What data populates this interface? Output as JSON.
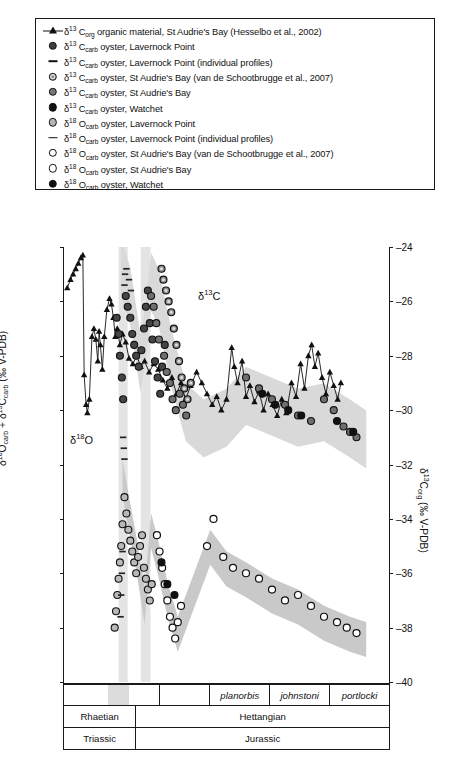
{
  "legend": {
    "items": [
      {
        "marker": "triangle-line",
        "delta": "13",
        "element": "C",
        "sub": "org",
        "text": " organic material, St Audrie's Bay (Hesselbo et al., 2002)"
      },
      {
        "marker": "circle-dark-fill",
        "delta": "13",
        "element": "C",
        "sub": "carb",
        "text": " oyster, Lavernock Point"
      },
      {
        "marker": "dash",
        "delta": "13",
        "element": "C",
        "sub": "carb",
        "text": " oyster, Lavernock Point (individual profiles)"
      },
      {
        "marker": "circle-ring",
        "delta": "13",
        "element": "C",
        "sub": "carb",
        "text": " oyster, St Audrie's Bay (van de Schootbrugge et al., 2007)"
      },
      {
        "marker": "circle-gray",
        "delta": "13",
        "element": "C",
        "sub": "carb",
        "text": " oyster, St Audrie's Bay"
      },
      {
        "marker": "circle-black",
        "delta": "13",
        "element": "C",
        "sub": "carb",
        "text": " oyster, Watchet"
      },
      {
        "marker": "circle-ltgray",
        "delta": "18",
        "element": "O",
        "sub": "carb",
        "text": " oyster, Lavernock Point"
      },
      {
        "marker": "dash",
        "delta": "18",
        "element": "O",
        "sub": "carb",
        "text": " oyster, Lavernock Point (individual profiles)"
      },
      {
        "marker": "circle-open",
        "delta": "18",
        "element": "O",
        "sub": "carb",
        "text": " oyster, St Audrie's Bay (van de Schootbrugge et al., 2007)"
      },
      {
        "marker": "circle-open",
        "delta": "18",
        "element": "O",
        "sub": "carb",
        "text": " oyster, St Audrie's Bay"
      },
      {
        "marker": "circle-black",
        "delta": "18",
        "element": "O",
        "sub": "carb",
        "text": " oyster, Watchet"
      }
    ]
  },
  "annotations": {
    "carbon": "δ13C",
    "oxygen": "δ18O"
  },
  "stratigraphy": {
    "biozones": [
      {
        "label": "",
        "span": 1.0
      },
      {
        "label": "",
        "span": 0.52
      },
      {
        "label": "planorbis",
        "span": 0.62
      },
      {
        "label": "johnstoni",
        "span": 0.62
      },
      {
        "label": "portlocki",
        "span": 0.62
      }
    ],
    "stages": [
      {
        "label": "Rhaetian",
        "span": 0.22
      },
      {
        "label": "Hettangian",
        "span": 0.78
      }
    ],
    "periods": [
      {
        "label": "Triassic",
        "span": 0.22
      },
      {
        "label": "Jurassic",
        "span": 0.78
      }
    ]
  },
  "chart_data": {
    "type": "scatter",
    "title": "",
    "xlabel": "",
    "grid": false,
    "legend_position": "top",
    "axes": {
      "left": {
        "label": "δ18Ocarb + δ13Ccarb (‰ V-PDB)",
        "ticks": [
          5,
          4,
          3,
          2,
          1,
          0,
          -1,
          -2,
          -3
        ],
        "ylim": [
          -3,
          5
        ]
      },
      "right": {
        "label": "δ13Corg (‰ V-PDB)",
        "ticks": [
          -24,
          -26,
          -28,
          -30,
          -32,
          -34,
          -36,
          -38,
          -40
        ],
        "ylim": [
          -40,
          -24
        ]
      }
    },
    "series": [
      {
        "name": "δ13Corg organic material, St Audrie's Bay (Hesselbo et al., 2002)",
        "marker": "triangle-line",
        "axis": "right",
        "points": [
          [
            0.01,
            -25.5
          ],
          [
            0.02,
            -25.2
          ],
          [
            0.028,
            -25.0
          ],
          [
            0.036,
            -24.8
          ],
          [
            0.044,
            -24.6
          ],
          [
            0.052,
            -24.4
          ],
          [
            0.058,
            -24.3
          ],
          [
            0.062,
            -28.7
          ],
          [
            0.068,
            -29.8
          ],
          [
            0.072,
            -30.1
          ],
          [
            0.078,
            -29.6
          ],
          [
            0.086,
            -27.3
          ],
          [
            0.092,
            -27.0
          ],
          [
            0.098,
            -27.4
          ],
          [
            0.104,
            -28.2
          ],
          [
            0.108,
            -27.1
          ],
          [
            0.112,
            -27.6
          ],
          [
            0.118,
            -28.5
          ],
          [
            0.124,
            -27.3
          ],
          [
            0.132,
            -26.3
          ],
          [
            0.14,
            -25.9
          ],
          [
            0.146,
            -26.1
          ],
          [
            0.152,
            -26.6
          ],
          [
            0.158,
            -27.3
          ],
          [
            0.164,
            -27.0
          ],
          [
            0.172,
            -27.6
          ],
          [
            0.18,
            -27.2
          ],
          [
            0.19,
            -27.5
          ],
          [
            0.2,
            -28.1
          ],
          [
            0.212,
            -28.3
          ],
          [
            0.224,
            -28.0
          ],
          [
            0.236,
            -28.4
          ],
          [
            0.248,
            -28.2
          ],
          [
            0.262,
            -28.6
          ],
          [
            0.276,
            -28.3
          ],
          [
            0.29,
            -28.5
          ],
          [
            0.304,
            -28.9
          ],
          [
            0.318,
            -29.2
          ],
          [
            0.332,
            -28.8
          ],
          [
            0.346,
            -29.4
          ],
          [
            0.36,
            -29.0
          ],
          [
            0.374,
            -29.6
          ],
          [
            0.39,
            -29.1
          ],
          [
            0.408,
            -28.6
          ],
          [
            0.424,
            -29.0
          ],
          [
            0.44,
            -29.4
          ],
          [
            0.456,
            -29.8
          ],
          [
            0.47,
            -29.5
          ],
          [
            0.484,
            -30.0
          ],
          [
            0.5,
            -29.6
          ],
          [
            0.516,
            -27.7
          ],
          [
            0.524,
            -28.4
          ],
          [
            0.534,
            -29.0
          ],
          [
            0.548,
            -28.2
          ],
          [
            0.56,
            -29.5
          ],
          [
            0.572,
            -29.1
          ],
          [
            0.586,
            -29.7
          ],
          [
            0.6,
            -29.3
          ],
          [
            0.614,
            -30.0
          ],
          [
            0.628,
            -29.4
          ],
          [
            0.642,
            -29.8
          ],
          [
            0.656,
            -30.2
          ],
          [
            0.67,
            -29.6
          ],
          [
            0.684,
            -30.1
          ],
          [
            0.7,
            -29.0
          ],
          [
            0.714,
            -29.5
          ],
          [
            0.728,
            -28.3
          ],
          [
            0.74,
            -29.2
          ],
          [
            0.752,
            -28.0
          ],
          [
            0.762,
            -27.6
          ],
          [
            0.772,
            -28.4
          ],
          [
            0.782,
            -27.9
          ],
          [
            0.794,
            -28.8
          ],
          [
            0.806,
            -29.4
          ],
          [
            0.818,
            -28.6
          ],
          [
            0.83,
            -29.1
          ],
          [
            0.842,
            -29.6
          ],
          [
            0.852,
            -29.0
          ]
        ]
      },
      {
        "name": "δ13Ccarb oyster, Lavernock Point",
        "marker": "circle-dark-fill",
        "axis": "left",
        "points": [
          [
            0.19,
            4.1
          ],
          [
            0.196,
            3.9
          ],
          [
            0.204,
            3.7
          ],
          [
            0.21,
            3.4
          ],
          [
            0.216,
            3.2
          ],
          [
            0.222,
            3.0
          ],
          [
            0.23,
            2.8
          ],
          [
            0.238,
            3.1
          ],
          [
            0.246,
            3.5
          ],
          [
            0.252,
            3.9
          ],
          [
            0.258,
            4.2
          ],
          [
            0.264,
            3.6
          ],
          [
            0.272,
            3.3
          ],
          [
            0.28,
            2.9
          ],
          [
            0.288,
            2.6
          ],
          [
            0.296,
            2.3
          ],
          [
            0.302,
            2.8
          ],
          [
            0.31,
            3.2
          ],
          [
            0.172,
            3.0
          ],
          [
            0.178,
            2.6
          ],
          [
            0.182,
            2.2
          ],
          [
            0.168,
            3.4
          ],
          [
            0.162,
            3.7
          ]
        ]
      },
      {
        "name": "δ13Ccarb oyster, Lavernock Point (individual profiles)",
        "marker": "dash",
        "axis": "left",
        "points": [
          [
            0.186,
            4.3
          ],
          [
            0.188,
            4.5
          ],
          [
            0.192,
            4.6
          ],
          [
            0.2,
            4.4
          ],
          [
            0.206,
            4.2
          ]
        ]
      },
      {
        "name": "δ13Ccarb oyster, St Audrie's Bay (van de Schootbrugge et al., 2007)",
        "marker": "circle-ring",
        "axis": "left",
        "points": [
          [
            0.3,
            4.6
          ],
          [
            0.306,
            4.4
          ],
          [
            0.314,
            4.2
          ],
          [
            0.322,
            4.0
          ],
          [
            0.33,
            3.8
          ],
          [
            0.338,
            3.5
          ],
          [
            0.346,
            3.2
          ],
          [
            0.354,
            2.9
          ],
          [
            0.362,
            2.6
          ],
          [
            0.37,
            2.4
          ],
          [
            0.38,
            2.2
          ],
          [
            0.39,
            2.5
          ]
        ]
      },
      {
        "name": "δ13Ccarb oyster, St Audrie's Bay",
        "marker": "circle-gray",
        "axis": "left",
        "points": [
          [
            0.268,
            4.1
          ],
          [
            0.276,
            3.9
          ],
          [
            0.284,
            3.6
          ],
          [
            0.292,
            3.3
          ],
          [
            0.308,
            3.0
          ],
          [
            0.316,
            2.7
          ],
          [
            0.326,
            2.5
          ],
          [
            0.334,
            2.2
          ],
          [
            0.344,
            2.0
          ],
          [
            0.356,
            2.3
          ],
          [
            0.366,
            2.1
          ],
          [
            0.376,
            1.9
          ],
          [
            0.56,
            2.6
          ],
          [
            0.6,
            2.4
          ],
          [
            0.64,
            2.2
          ],
          [
            0.68,
            2.1
          ],
          [
            0.72,
            1.9
          ],
          [
            0.76,
            1.8
          ],
          [
            0.8,
            2.2
          ],
          [
            0.83,
            2.0
          ],
          [
            0.86,
            1.7
          ],
          [
            0.88,
            1.6
          ],
          [
            0.9,
            1.5
          ]
        ]
      },
      {
        "name": "δ13Ccarb oyster, Watchet",
        "marker": "circle-black",
        "axis": "left",
        "points": [
          [
            0.61,
            2.3
          ],
          [
            0.65,
            2.1
          ],
          [
            0.69,
            2.0
          ],
          [
            0.73,
            1.9
          ],
          [
            0.84,
            1.8
          ],
          [
            0.89,
            1.6
          ]
        ]
      },
      {
        "name": "δ18Ocarb oyster, Lavernock Point",
        "marker": "circle-ltgray",
        "axis": "left",
        "points": [
          [
            0.186,
            0.4
          ],
          [
            0.192,
            0.1
          ],
          [
            0.198,
            -0.2
          ],
          [
            0.204,
            -0.4
          ],
          [
            0.21,
            -0.6
          ],
          [
            0.216,
            -0.8
          ],
          [
            0.222,
            -1.0
          ],
          [
            0.228,
            -0.7
          ],
          [
            0.234,
            -0.5
          ],
          [
            0.24,
            -0.3
          ],
          [
            0.246,
            -0.9
          ],
          [
            0.252,
            -1.1
          ],
          [
            0.258,
            -1.3
          ],
          [
            0.264,
            -1.5
          ],
          [
            0.27,
            -1.2
          ],
          [
            0.18,
            -0.1
          ],
          [
            0.176,
            -0.5
          ],
          [
            0.172,
            -0.8
          ],
          [
            0.168,
            -1.1
          ],
          [
            0.164,
            -1.4
          ],
          [
            0.16,
            -1.7
          ],
          [
            0.156,
            -2.0
          ]
        ]
      },
      {
        "name": "δ18Ocarb oyster, Lavernock Point (individual profiles)",
        "marker": "dash",
        "axis": "left",
        "points": [
          [
            0.182,
            1.5
          ],
          [
            0.184,
            1.3
          ],
          [
            0.186,
            1.1
          ],
          [
            0.18,
            -0.6
          ],
          [
            0.178,
            -1.0
          ],
          [
            0.176,
            -1.4
          ],
          [
            0.174,
            -1.8
          ]
        ]
      },
      {
        "name": "δ18Ocarb oyster, St Audrie's Bay (van de Schootbrugge et al., 2007)",
        "marker": "circle-open",
        "axis": "left",
        "points": [
          [
            0.286,
            -0.3
          ],
          [
            0.294,
            -0.6
          ],
          [
            0.302,
            -0.9
          ],
          [
            0.31,
            -1.2
          ],
          [
            0.318,
            -1.5
          ],
          [
            0.326,
            -1.8
          ],
          [
            0.334,
            -2.0
          ],
          [
            0.342,
            -2.2
          ],
          [
            0.35,
            -1.9
          ],
          [
            0.36,
            -1.6
          ]
        ]
      },
      {
        "name": "δ18Ocarb oyster, St Audrie's Bay",
        "marker": "circle-open",
        "axis": "left",
        "points": [
          [
            0.56,
            -1.0
          ],
          [
            0.6,
            -1.1
          ],
          [
            0.64,
            -1.3
          ],
          [
            0.68,
            -1.5
          ],
          [
            0.72,
            -1.4
          ],
          [
            0.76,
            -1.6
          ],
          [
            0.8,
            -1.8
          ],
          [
            0.84,
            -1.9
          ],
          [
            0.87,
            -2.0
          ],
          [
            0.9,
            -2.1
          ],
          [
            0.52,
            -0.9
          ],
          [
            0.49,
            -0.7
          ],
          [
            0.46,
            0.0
          ],
          [
            0.44,
            -0.5
          ]
        ]
      },
      {
        "name": "δ18Ocarb oyster, Watchet",
        "marker": "circle-black",
        "axis": "left",
        "points": [
          [
            0.3,
            -0.8
          ],
          [
            0.318,
            -1.2
          ],
          [
            0.34,
            -1.4
          ]
        ]
      }
    ]
  }
}
